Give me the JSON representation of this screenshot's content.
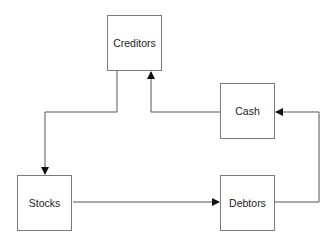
{
  "diagram": {
    "type": "flowchart",
    "nodes": [
      {
        "id": "creditors",
        "label": "Creditors"
      },
      {
        "id": "cash",
        "label": "Cash"
      },
      {
        "id": "stocks",
        "label": "Stocks"
      },
      {
        "id": "debtors",
        "label": "Debtors"
      }
    ],
    "edges": [
      {
        "from": "creditors",
        "to": "stocks"
      },
      {
        "from": "stocks",
        "to": "debtors"
      },
      {
        "from": "debtors",
        "to": "cash"
      },
      {
        "from": "cash",
        "to": "creditors"
      }
    ],
    "colors": {
      "line": "#555555",
      "box_border": "#7a7a7a",
      "text": "#222222"
    }
  }
}
